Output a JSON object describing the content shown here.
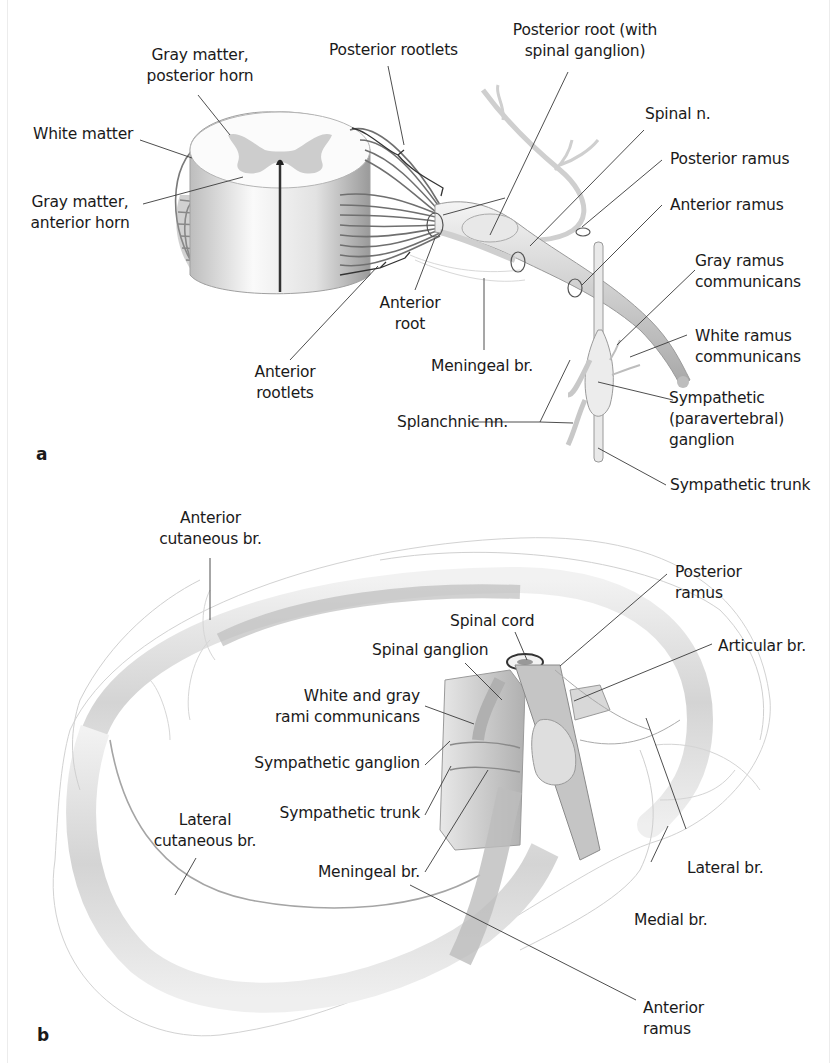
{
  "figure": {
    "panel_a": {
      "letter": "a",
      "labels": {
        "gray_posterior_1": "Gray matter,",
        "gray_posterior_2": "posterior horn",
        "posterior_rootlets": "Posterior rootlets",
        "posterior_root_1": "Posterior root (with",
        "posterior_root_2": "spinal ganglion)",
        "white_matter": "White matter",
        "spinal_n": "Spinal n.",
        "posterior_ramus": "Posterior ramus",
        "gray_anterior_1": "Gray matter,",
        "gray_anterior_2": "anterior horn",
        "anterior_ramus": "Anterior ramus",
        "gray_ramus_1": "Gray ramus",
        "gray_ramus_2": "communicans",
        "anterior_root_1": "Anterior",
        "anterior_root_2": "root",
        "white_ramus_1": "White ramus",
        "white_ramus_2": "communicans",
        "anterior_rootlets_1": "Anterior",
        "anterior_rootlets_2": "rootlets",
        "meningeal_br": "Meningeal br.",
        "sympathetic_ganglion_1": "Sympathetic",
        "sympathetic_ganglion_2": "(paravertebral)",
        "sympathetic_ganglion_3": "ganglion",
        "splanchnic_nn": "Splanchnic nn.",
        "sympathetic_trunk": "Sympathetic trunk"
      }
    },
    "panel_b": {
      "letter": "b",
      "labels": {
        "anterior_cutaneous_1": "Anterior",
        "anterior_cutaneous_2": "cutaneous br.",
        "posterior_ramus_1": "Posterior",
        "posterior_ramus_2": "ramus",
        "spinal_cord": "Spinal cord",
        "spinal_ganglion": "Spinal ganglion",
        "articular_br": "Articular br.",
        "rami_communicans_1": "White and gray",
        "rami_communicans_2": "rami communicans",
        "sympathetic_ganglion": "Sympathetic ganglion",
        "sympathetic_trunk": "Sympathetic trunk",
        "lateral_cutaneous_1": "Lateral",
        "lateral_cutaneous_2": "cutaneous br.",
        "meningeal_br": "Meningeal br.",
        "lateral_br": "Lateral br.",
        "medial_br": "Medial br.",
        "anterior_ramus_1": "Anterior",
        "anterior_ramus_2": "ramus"
      }
    },
    "colors": {
      "background": "#ffffff",
      "label_text": "#1a1a1a",
      "leader_line": "#3a3a3a",
      "nerve_fill": "#e6e6e6",
      "gray_matter": "#c9c9c9",
      "outline": "#8a8a8a"
    }
  }
}
